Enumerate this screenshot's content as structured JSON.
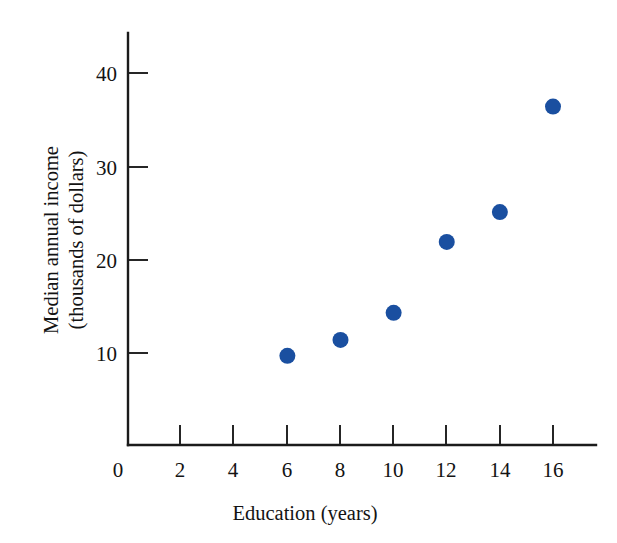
{
  "chart_data": {
    "type": "scatter",
    "title": "",
    "xlabel": "Education (years)",
    "ylabel_line1": "Median annual income",
    "ylabel_line2": "(thousands of dollars)",
    "x": [
      6,
      8,
      10,
      12,
      14,
      16
    ],
    "values": [
      9.7,
      11.4,
      14.3,
      21.9,
      25.1,
      36.4
    ],
    "series": [
      {
        "name": "Median annual income",
        "points": [
          {
            "x": 6,
            "y": 9.7
          },
          {
            "x": 8,
            "y": 11.4
          },
          {
            "x": 10,
            "y": 14.3
          },
          {
            "x": 12,
            "y": 21.9
          },
          {
            "x": 14,
            "y": 25.1
          },
          {
            "x": 16,
            "y": 36.4
          }
        ]
      }
    ],
    "xlim": [
      0,
      17.5
    ],
    "ylim": [
      0,
      43.5
    ],
    "xticks": [
      0,
      2,
      4,
      6,
      8,
      10,
      12,
      14,
      16
    ],
    "xticklabels": [
      "0",
      "2",
      "4",
      "6",
      "8",
      "10",
      "12",
      "14",
      "16"
    ],
    "yticks": [
      10,
      20,
      30,
      40
    ],
    "yticklabels": [
      "10",
      "20",
      "30",
      "40"
    ],
    "grid": false,
    "legend": false,
    "legend_position": "none",
    "marker": "circle",
    "marker_color": "#1a4fa0",
    "marker_size_px": 16,
    "axis_color": "#1b1b1b",
    "background_color": "#ffffff"
  }
}
